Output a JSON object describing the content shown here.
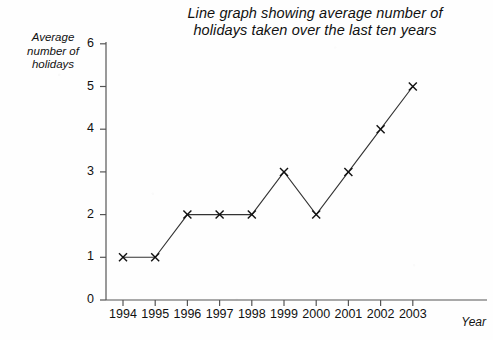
{
  "chart_data": {
    "type": "line",
    "title": "Line graph showing average number of holidays taken over the last ten years",
    "title_lines": [
      "Line graph showing average number of",
      "holidays taken over the last ten years"
    ],
    "xlabel": "Year",
    "ylabel": "Average number of holidays",
    "ylabel_lines": [
      "Average",
      "number of",
      "holidays"
    ],
    "categories": [
      "1994",
      "1995",
      "1996",
      "1997",
      "1998",
      "1999",
      "2000",
      "2001",
      "2002",
      "2003"
    ],
    "values": [
      1,
      1,
      2,
      2,
      2,
      3,
      2,
      3,
      4,
      5
    ],
    "x": [
      1994,
      1995,
      1996,
      1997,
      1998,
      1999,
      2000,
      2001,
      2002,
      2003
    ],
    "ylim": [
      0,
      6
    ],
    "yticks": [
      "0",
      "1",
      "2",
      "3",
      "4",
      "5",
      "6"
    ],
    "xticks": [
      "1994",
      "1995",
      "1996",
      "1997",
      "1998",
      "1999",
      "2000",
      "2001",
      "2002",
      "2003"
    ],
    "grid": false,
    "legend": "none",
    "marker": "x",
    "line_color": "#333333",
    "marker_color": "#111111",
    "axis_color": "#555555",
    "background_color": "#fefefe"
  }
}
